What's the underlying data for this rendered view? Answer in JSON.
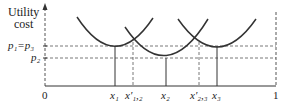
{
  "diagram": {
    "y_axis_label_line1": "Utility",
    "y_axis_label_line2": "cost",
    "y_ticks": [
      {
        "label": "p₁=p₃",
        "y": 46
      },
      {
        "label": "p₂",
        "y": 58
      }
    ],
    "x_ticks": [
      {
        "label": "0",
        "x": 45
      },
      {
        "label": "x₁",
        "x": 115
      },
      {
        "label": "x′₁,₂",
        "x": 133
      },
      {
        "label": "x₂",
        "x": 166
      },
      {
        "label": "x′₂,₃",
        "x": 199
      },
      {
        "label": "x₃",
        "x": 217
      },
      {
        "label": "1",
        "x": 276
      }
    ],
    "curves": [
      {
        "name": "utility-curve-1",
        "min_x": 115,
        "min_y": 46
      },
      {
        "name": "utility-curve-2",
        "min_x": 166,
        "min_y": 58
      },
      {
        "name": "utility-curve-3",
        "min_x": 217,
        "min_y": 46
      }
    ],
    "colors": {
      "line": "#333333",
      "dash": "#555555"
    }
  }
}
